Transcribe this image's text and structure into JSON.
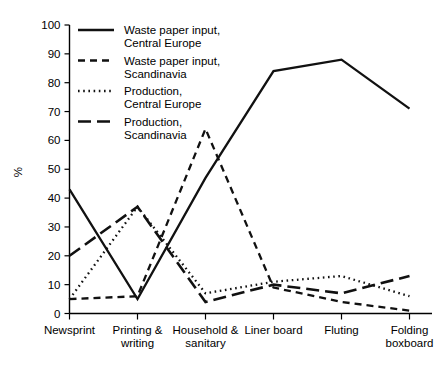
{
  "chart_data": {
    "type": "line",
    "title": "",
    "xlabel": "",
    "ylabel": "%",
    "ylim": [
      0,
      100
    ],
    "ytick_step": 10,
    "grid": false,
    "legend_position": "top-left inside plot",
    "categories": [
      "Newsprint",
      "Printing & writing",
      "Household & sanitary",
      "Liner board",
      "Fluting",
      "Folding boxboard"
    ],
    "yticks": [
      0,
      10,
      20,
      30,
      40,
      50,
      60,
      70,
      80,
      90,
      100
    ],
    "series": [
      {
        "name": "Waste paper input, Central Europe",
        "style": "solid",
        "values": [
          43,
          5,
          47,
          84,
          88,
          71
        ]
      },
      {
        "name": "Waste paper input, Scandinavia",
        "style": "short-dash",
        "values": [
          5,
          6,
          64,
          9,
          4,
          1
        ]
      },
      {
        "name": "Production, Central Europe",
        "style": "dotted",
        "values": [
          5,
          37,
          7,
          11,
          13,
          6
        ]
      },
      {
        "name": "Production, Scandinavia",
        "style": "long-dash",
        "values": [
          20,
          37,
          4,
          10,
          7,
          13
        ]
      }
    ]
  },
  "axis": {
    "y_title": "%",
    "y_tick_labels": [
      "0",
      "10",
      "20",
      "30",
      "40",
      "50",
      "60",
      "70",
      "80",
      "90",
      "100"
    ],
    "x_category_lines": [
      [
        "Newsprint"
      ],
      [
        "Printing &",
        "writing"
      ],
      [
        "Household &",
        "sanitary"
      ],
      [
        "Liner board"
      ],
      [
        "Fluting"
      ],
      [
        "Folding",
        "boxboard"
      ]
    ]
  },
  "legend": {
    "entries": [
      {
        "line1": "Waste paper input,",
        "line2": "Central Europe",
        "style": "solid"
      },
      {
        "line1": "Waste paper input,",
        "line2": "Scandinavia",
        "style": "short-dash"
      },
      {
        "line1": "Production,",
        "line2": "Central Europe",
        "style": "dotted"
      },
      {
        "line1": "Production,",
        "line2": "Scandinavia",
        "style": "long-dash"
      }
    ]
  },
  "colors": {
    "ink": "#111111",
    "background": "#ffffff"
  }
}
